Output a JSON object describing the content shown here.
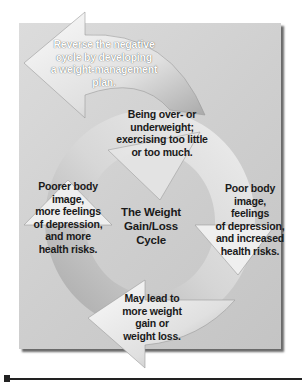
{
  "diagram": {
    "title": "The Weight\nGain/Loss\nCycle",
    "steps": [
      {
        "id": "reverse",
        "text": "Reverse the negative\ncycle by developing\na weight-management\nplan."
      },
      {
        "id": "over-under",
        "text": "Being over- or\nunderweight;\nexercising too little\nor too much."
      },
      {
        "id": "poor-body",
        "text": "Poor body\nimage,\nfeelings\nof depression,\nand increased\nhealth risks."
      },
      {
        "id": "may-lead",
        "text": "May lead to\nmore weight\ngain or\nweight loss."
      },
      {
        "id": "poorer-body",
        "text": "Poorer body\nimage,\nmore feelings\nof depression,\nand more\nhealth risks."
      }
    ],
    "colors": {
      "panel": "#d0d0d0",
      "arrow_light": "#f2f2f2",
      "arrow_dark": "#9a9a9a",
      "text": "#1a1a1a"
    }
  }
}
